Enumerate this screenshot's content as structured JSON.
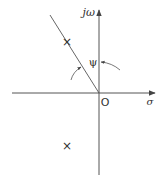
{
  "diagram": {
    "type": "s-plane pole plot",
    "axes": {
      "imaginary_label": "jω",
      "real_label": "σ",
      "origin_label": "O"
    },
    "angle_label": "ψ",
    "poles": [
      {
        "name": "upper-pole",
        "marker": "×"
      },
      {
        "name": "lower-pole",
        "marker": "×"
      }
    ],
    "colors": {
      "line": "#555555",
      "text": "#333333",
      "background": "#ffffff"
    }
  }
}
